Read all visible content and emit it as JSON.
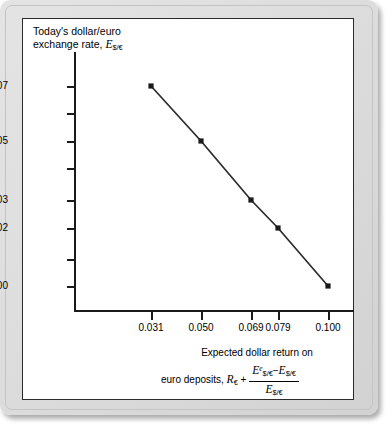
{
  "chart_data": {
    "type": "line",
    "title": "",
    "ylabel_line1": "Today's dollar/euro",
    "ylabel_line2": "exchange rate,",
    "ylabel_symbol": "E",
    "ylabel_symbol_sub": "$/€",
    "xlabel_line1": "Expected dollar return on",
    "xlabel_line2_lead": "euro deposits,",
    "xlabel_R": "R",
    "xlabel_R_sub": "€",
    "xlabel_plus": "+",
    "frac_numerator": {
      "term1_symbol": "E",
      "term1_sup": "e",
      "term1_sub": "$/€",
      "operator": "−",
      "term2_symbol": "E",
      "term2_sub": "$/€"
    },
    "frac_denominator": {
      "symbol": "E",
      "sub": "$/€"
    },
    "x": [
      0.031,
      0.05,
      0.069,
      0.079,
      0.1
    ],
    "y": [
      1.07,
      1.05,
      1.03,
      1.02,
      1.0
    ],
    "xtick_labels": [
      "0.031",
      "0.050",
      "0.069",
      "0.079",
      "0.100"
    ],
    "ytick_labels": [
      "1.07",
      "1.05",
      "1.03",
      "1.02",
      "1.00"
    ],
    "ytick_minor_count": 4,
    "xlim": [
      0.031,
      0.1
    ],
    "ylim": [
      1.0,
      1.07
    ],
    "grid": false,
    "legend": "none",
    "line_color": "#2b2b2b",
    "marker": "square",
    "marker_color": "#1a1a1a",
    "panel_background": "#ffffff",
    "frame_background": "#dedede"
  },
  "geometry": {
    "y_ticks": [
      {
        "label": "1.07",
        "top": 67
      },
      {
        "label": "",
        "top": 94
      },
      {
        "label": "1.05",
        "top": 122
      },
      {
        "label": "",
        "top": 149
      },
      {
        "label": "1.03",
        "top": 181
      },
      {
        "label": "1.02",
        "top": 209
      },
      {
        "label": "",
        "top": 240
      },
      {
        "label": "1.00",
        "top": 267
      }
    ],
    "x_ticks": [
      {
        "label": "0.031",
        "left": 128
      },
      {
        "label": "0.050",
        "left": 178
      },
      {
        "label": "0.069",
        "left": 228
      },
      {
        "label": "0.079",
        "left": 255
      },
      {
        "label": "0.100",
        "left": 305
      }
    ],
    "points": [
      {
        "cx": 128,
        "cy": 67
      },
      {
        "cx": 178,
        "cy": 122
      },
      {
        "cx": 228,
        "cy": 181
      },
      {
        "cx": 255,
        "cy": 209
      },
      {
        "cx": 305,
        "cy": 267
      }
    ]
  }
}
